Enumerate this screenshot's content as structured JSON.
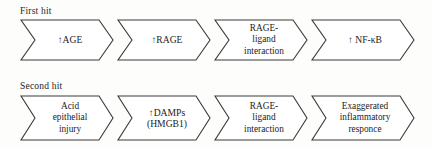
{
  "figure": {
    "background_color": "#fdfdfb",
    "stroke_color": "#3a3a3a",
    "text_color": "#1b1b1b"
  },
  "rows": [
    {
      "label": "First hit",
      "steps": [
        {
          "text": "↑AGE",
          "name": "age"
        },
        {
          "text": "↑RAGE",
          "name": "rage"
        },
        {
          "text": "RAGE-\nligand\ninteraction",
          "name": "rage-ligand-interaction"
        },
        {
          "text": "↑ NF-κB",
          "name": "nf-kb"
        }
      ]
    },
    {
      "label": "Second hit",
      "steps": [
        {
          "text": "Acid\nepithelial\ninjury",
          "name": "acid-epithelial-injury"
        },
        {
          "text": "↑DAMPs\n(HMGB1)",
          "name": "damps-hmgb1"
        },
        {
          "text": "RAGE-\nligand\ninteraction",
          "name": "rage-ligand-interaction"
        },
        {
          "text": "Exaggerated\ninflammatory\nresponce",
          "name": "exaggerated-inflammatory-responce"
        }
      ]
    }
  ]
}
